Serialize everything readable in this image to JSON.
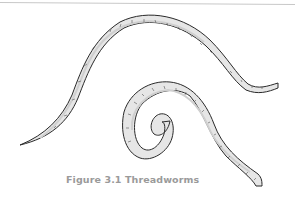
{
  "figure": {
    "caption": "Figure 3.1 Threadworms",
    "illustration": "two-threadworms-line-drawing",
    "colors": {
      "outline": "#2a2a2a",
      "body_fill": "#e6e6e6",
      "shade": "#cfcfcf",
      "caption": "#9a9a9a",
      "rule": "#c8c8c8"
    }
  }
}
